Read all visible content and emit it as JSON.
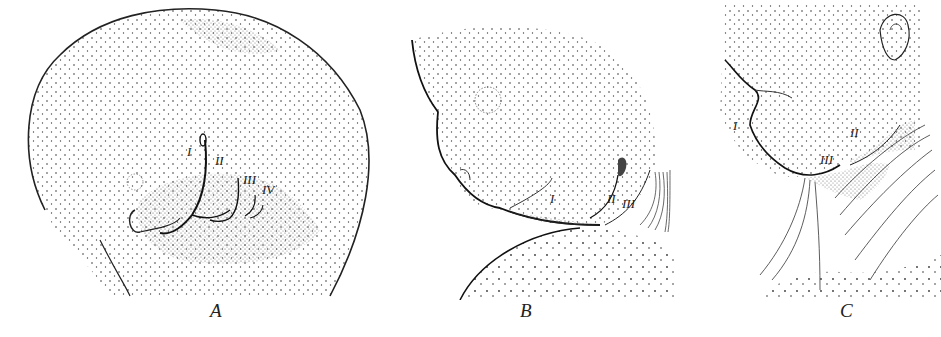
{
  "figure": {
    "type": "stippled anatomical illustration",
    "panels": [
      {
        "id": "A",
        "caption": "A",
        "labels": [
          "I",
          "II",
          "III",
          "IV"
        ]
      },
      {
        "id": "B",
        "caption": "B",
        "labels": [
          "I",
          "II",
          "III"
        ]
      },
      {
        "id": "C",
        "caption": "C",
        "labels": [
          "I",
          "II",
          "III"
        ]
      }
    ]
  }
}
